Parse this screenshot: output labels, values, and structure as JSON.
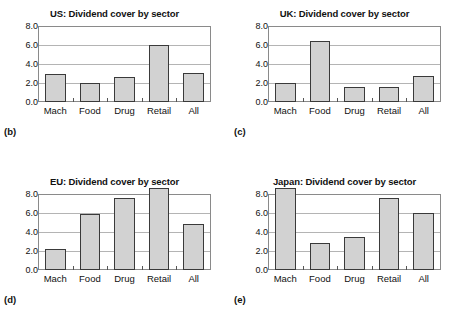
{
  "figure": {
    "background_color": "#ffffff",
    "bar_fill_color": "#d2d2d2",
    "bar_edge_color": "#3a3a3a",
    "gridline_color": "#b4b4b4",
    "axis_color": "#8a8a8a"
  },
  "panels": [
    {
      "letter": "(b)",
      "title": "US: Dividend cover by sector",
      "chart_data": {
        "type": "bar",
        "title": "US: Dividend cover by sector",
        "xlabel": "",
        "ylabel": "",
        "categories": [
          "Mach",
          "Food",
          "Drug",
          "Retail",
          "All"
        ],
        "values": [
          3.0,
          2.05,
          2.6,
          6.0,
          3.05
        ],
        "ylim": [
          0.0,
          8.0
        ],
        "yticks": [
          0.0,
          2.0,
          4.0,
          6.0,
          8.0
        ],
        "ytick_labels": [
          "0.0",
          "2.0",
          "4.0",
          "6.0",
          "8.0"
        ],
        "grid": true,
        "legend": "none"
      }
    },
    {
      "letter": "(c)",
      "title": "UK: Dividend cover by sector",
      "chart_data": {
        "type": "bar",
        "title": "UK: Dividend cover by sector",
        "xlabel": "",
        "ylabel": "",
        "categories": [
          "Mach",
          "Food",
          "Drug",
          "Retail",
          "All"
        ],
        "values": [
          1.95,
          6.45,
          1.55,
          1.6,
          2.75
        ],
        "ylim": [
          0.0,
          8.0
        ],
        "yticks": [
          0.0,
          2.0,
          4.0,
          6.0,
          8.0
        ],
        "ytick_labels": [
          "0.0",
          "2.0",
          "4.0",
          "6.0",
          "8.0"
        ],
        "grid": true,
        "legend": "none"
      }
    },
    {
      "letter": "(d)",
      "title": "EU: Dividend cover by sector",
      "chart_data": {
        "type": "bar",
        "title": "EU: Dividend cover by sector",
        "xlabel": "",
        "ylabel": "",
        "categories": [
          "Mach",
          "Food",
          "Drug",
          "Retail",
          "All"
        ],
        "values": [
          2.2,
          5.9,
          7.6,
          8.6,
          4.8
        ],
        "ylim": [
          0.0,
          8.0
        ],
        "yticks": [
          0.0,
          2.0,
          4.0,
          6.0,
          8.0
        ],
        "ytick_labels": [
          "0.0",
          "2.0",
          "4.0",
          "6.0",
          "8.0"
        ],
        "grid": true,
        "legend": "none",
        "notes": "Retail bar exceeds the 8.0 axis maximum and is drawn clipped above the plot frame"
      }
    },
    {
      "letter": "(e)",
      "title": "Japan: Dividend cover by sector",
      "chart_data": {
        "type": "bar",
        "title": "Japan: Dividend cover by sector",
        "xlabel": "",
        "ylabel": "",
        "categories": [
          "Mach",
          "Food",
          "Drug",
          "Retail",
          "All"
        ],
        "values": [
          8.6,
          2.8,
          3.5,
          7.6,
          6.05
        ],
        "ylim": [
          0.0,
          8.0
        ],
        "yticks": [
          0.0,
          2.0,
          4.0,
          6.0,
          8.0
        ],
        "ytick_labels": [
          "0.0",
          "2.0",
          "4.0",
          "6.0",
          "8.0"
        ],
        "grid": true,
        "legend": "none",
        "notes": "Mach bar exceeds the 8.0 axis maximum and is drawn clipped above the plot frame"
      }
    }
  ]
}
